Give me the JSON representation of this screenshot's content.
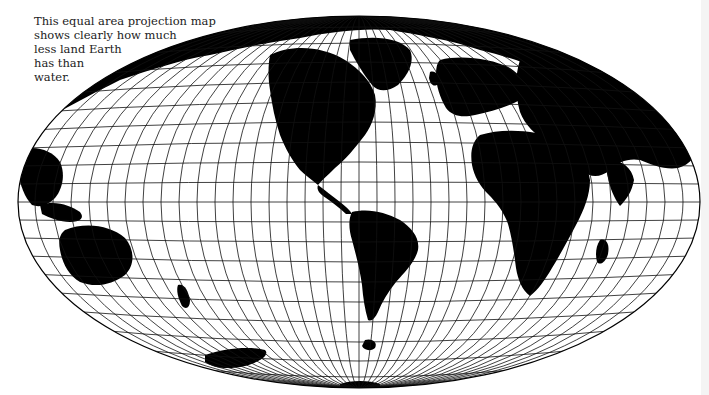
{
  "caption": {
    "lines": [
      "This equal area projection map",
      "shows clearly how much",
      "less land Earth",
      "has than",
      "water."
    ]
  },
  "map": {
    "projection": "equal-area (Hammer/Mollweide-style ellipse)",
    "ink_color": "#000000",
    "paper_color": "#ffffff",
    "regions_visible": [
      "North America",
      "South America",
      "Europe",
      "Africa",
      "Asia",
      "Australia",
      "Antarctica",
      "Greenland"
    ]
  }
}
